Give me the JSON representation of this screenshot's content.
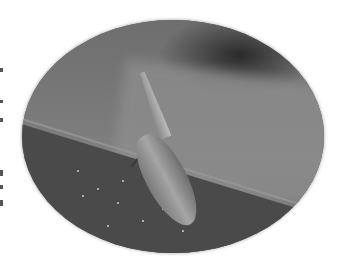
{
  "image": {
    "description": "Grayscale macro photograph of a leafhopper/planthopper insect with an elongated pointed head resting on the edge of a leaf, presented inside an oval vignette frame on a white background.",
    "subject": "insect",
    "frame_shape": "oval",
    "colors": {
      "background": "#ffffff",
      "leaf_dark": "#4a4a4a",
      "backdrop": "#7a7a7a",
      "insect_highlight": "#bdbdbd"
    }
  }
}
